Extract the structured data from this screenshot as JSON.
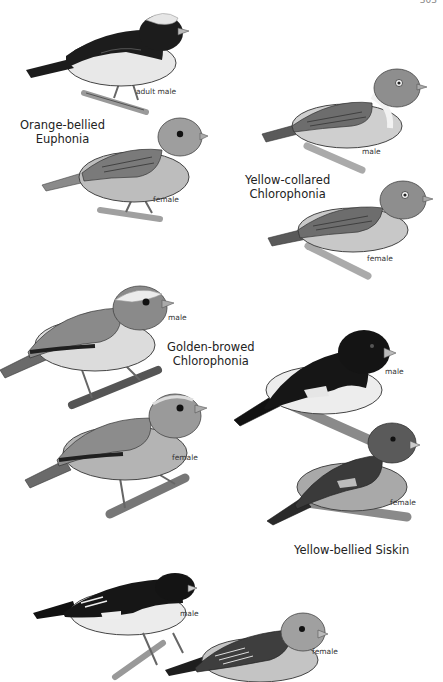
{
  "page": {
    "page_number": "303"
  },
  "plates": [
    {
      "species": "Orange-bellied Euphonia",
      "species_lines": [
        "Orange-bellied",
        "Euphonia"
      ],
      "birds": [
        {
          "label": "adult male",
          "plumage": "dark back and throat, pale crown, light belly"
        },
        {
          "label": "female",
          "plumage": "olive, grayish head"
        }
      ]
    },
    {
      "species": "Yellow-collared Chlorophonia",
      "species_lines": [
        "Yellow-collared",
        "Chlorophonia"
      ],
      "birds": [
        {
          "label": "male",
          "plumage": "green head, pale collar band"
        },
        {
          "label": "female",
          "plumage": "green overall"
        }
      ]
    },
    {
      "species": "Golden-browed Chlorophonia",
      "species_lines": [
        "Golden-browed",
        "Chlorophonia"
      ],
      "birds": [
        {
          "label": "male",
          "plumage": "green with pale brow, yellow belly"
        },
        {
          "label": "female",
          "plumage": "green, paler belly"
        }
      ]
    },
    {
      "species": "Yellow-bellied Siskin",
      "species_lines": [
        "Yellow-bellied Siskin"
      ],
      "birds": [
        {
          "label": "male",
          "plumage": "black hood and back, yellow belly, wing patch"
        },
        {
          "label": "female",
          "plumage": "olive, darker wings"
        }
      ]
    },
    {
      "species": "",
      "species_lines": [],
      "birds": [
        {
          "label": "male",
          "plumage": "dark head and back, pale underparts"
        },
        {
          "label": "female",
          "plumage": "streaked back, pale head"
        }
      ]
    }
  ],
  "colors": {
    "background": "#ffffff",
    "ink": "#1a1a1a",
    "dark": "#1c1c1c",
    "mid": "#8a8a8a",
    "light": "#d9d9d9"
  }
}
